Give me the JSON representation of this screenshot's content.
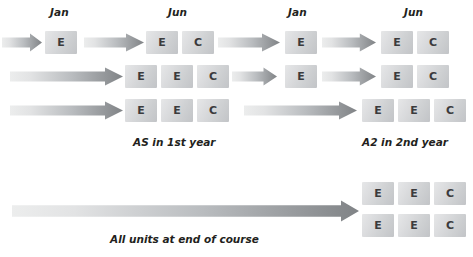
{
  "figure": {
    "title_fragment": "",
    "colors": {
      "box_light": "#e6e7e8",
      "box_dark": "#c2c4c7",
      "arrow_light": "#eceded",
      "arrow_dark": "#808386",
      "text": "#231f20",
      "glyph": "#3b3b3d",
      "background": "#ffffff"
    }
  },
  "month_labels": [
    {
      "text": "Jan",
      "x": 50,
      "y": 6
    },
    {
      "text": "Jun",
      "x": 168,
      "y": 6
    },
    {
      "text": "Jan",
      "x": 288,
      "y": 6
    },
    {
      "text": "Jun",
      "x": 404,
      "y": 6
    }
  ],
  "captions": [
    {
      "text": "AS in 1st year",
      "x": 133,
      "y": 136
    },
    {
      "text": "A2 in 2nd year",
      "x": 362,
      "y": 136
    },
    {
      "text": "All units at end of course",
      "x": 110,
      "y": 233
    }
  ],
  "rows": [
    {
      "id": "row-1",
      "y": 31,
      "arrows": [
        {
          "name": "arrow-start-row1",
          "x": 2,
          "width": 40,
          "y": 33,
          "height": 19
        },
        {
          "name": "arrow-jan-to-jun-row1",
          "x": 84,
          "width": 60,
          "y": 33,
          "height": 19
        },
        {
          "name": "arrow-jun-to-jan-row1",
          "x": 218,
          "width": 62,
          "y": 33,
          "height": 19
        },
        {
          "name": "arrow-jan-to-jun2-row1",
          "x": 322,
          "width": 54,
          "y": 33,
          "height": 19
        }
      ],
      "boxes": [
        {
          "label": "E",
          "x": 45,
          "y": 31
        },
        {
          "label": "E",
          "x": 146,
          "y": 31
        },
        {
          "label": "C",
          "x": 182,
          "y": 31
        },
        {
          "label": "E",
          "x": 285,
          "y": 31
        },
        {
          "label": "E",
          "x": 381,
          "y": 31
        },
        {
          "label": "C",
          "x": 417,
          "y": 31
        }
      ]
    },
    {
      "id": "row-2",
      "y": 65,
      "arrows": [
        {
          "name": "arrow-start-row2",
          "x": 10,
          "width": 113,
          "y": 67,
          "height": 19
        },
        {
          "name": "arrow-jun-to-jan-row2",
          "x": 232,
          "width": 45,
          "y": 67,
          "height": 19
        },
        {
          "name": "arrow-jan-to-jun-row2",
          "x": 322,
          "width": 54,
          "y": 67,
          "height": 19
        }
      ],
      "boxes": [
        {
          "label": "E",
          "x": 125,
          "y": 65
        },
        {
          "label": "E",
          "x": 161,
          "y": 65
        },
        {
          "label": "C",
          "x": 197,
          "y": 65
        },
        {
          "label": "E",
          "x": 285,
          "y": 65
        },
        {
          "label": "E",
          "x": 381,
          "y": 65
        },
        {
          "label": "C",
          "x": 417,
          "y": 65
        }
      ]
    },
    {
      "id": "row-3",
      "y": 99,
      "arrows": [
        {
          "name": "arrow-start-row3",
          "x": 10,
          "width": 113,
          "y": 101,
          "height": 19
        },
        {
          "name": "arrow-jun-to-jun-row3",
          "x": 244,
          "width": 113,
          "y": 101,
          "height": 19
        }
      ],
      "boxes": [
        {
          "label": "E",
          "x": 125,
          "y": 99
        },
        {
          "label": "E",
          "x": 161,
          "y": 99
        },
        {
          "label": "C",
          "x": 197,
          "y": 99
        },
        {
          "label": "E",
          "x": 362,
          "y": 99
        },
        {
          "label": "E",
          "x": 398,
          "y": 99
        },
        {
          "label": "C",
          "x": 434,
          "y": 99
        }
      ]
    }
  ],
  "bottom": {
    "arrow": {
      "name": "arrow-all-units",
      "x": 12,
      "width": 347,
      "y": 200,
      "height": 22
    },
    "box_rows": [
      {
        "boxes": [
          {
            "label": "E",
            "x": 362,
            "y": 182
          },
          {
            "label": "E",
            "x": 398,
            "y": 182
          },
          {
            "label": "C",
            "x": 434,
            "y": 182
          }
        ]
      },
      {
        "boxes": [
          {
            "label": "E",
            "x": 362,
            "y": 214
          },
          {
            "label": "E",
            "x": 398,
            "y": 214
          },
          {
            "label": "C",
            "x": 434,
            "y": 214
          }
        ]
      }
    ]
  }
}
